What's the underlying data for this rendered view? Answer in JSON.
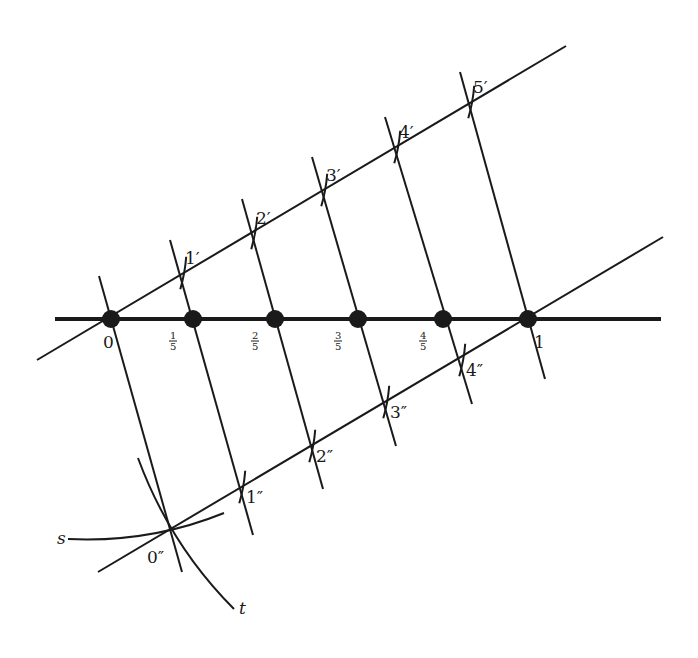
{
  "diagram": {
    "colors": {
      "ink": "#1a1a1a",
      "background": "#ffffff"
    },
    "main_line": {
      "name": "number-line",
      "from": [
        55,
        319
      ],
      "to": [
        661,
        319
      ],
      "width": 4,
      "points": [
        {
          "label": "0",
          "x": 111,
          "num": "",
          "den": "",
          "kind": "whole"
        },
        {
          "label": "1/5",
          "x": 193,
          "num": "1",
          "den": "5",
          "kind": "fraction"
        },
        {
          "label": "2/5",
          "x": 275,
          "num": "2",
          "den": "5",
          "kind": "fraction"
        },
        {
          "label": "3/5",
          "x": 358,
          "num": "3",
          "den": "5",
          "kind": "fraction"
        },
        {
          "label": "4/5",
          "x": 443,
          "num": "4",
          "den": "5",
          "kind": "fraction"
        },
        {
          "label": "1",
          "x": 528,
          "num": "",
          "den": "",
          "kind": "whole"
        }
      ]
    },
    "upper_line": {
      "from": [
        37,
        360
      ],
      "to": [
        566,
        46
      ],
      "points": [
        {
          "label": "1′",
          "x": 181,
          "y": 275
        },
        {
          "label": "2′",
          "x": 252,
          "y": 235
        },
        {
          "label": "3′",
          "x": 322,
          "y": 192
        },
        {
          "label": "4′",
          "x": 395,
          "y": 149
        },
        {
          "label": "5′",
          "x": 469,
          "y": 104
        }
      ]
    },
    "lower_line": {
      "from": [
        98,
        572
      ],
      "to": [
        663,
        237
      ],
      "points": [
        {
          "label": "0″",
          "x": 171,
          "y": 531
        },
        {
          "label": "1″",
          "x": 240,
          "y": 489
        },
        {
          "label": "2″",
          "x": 310,
          "y": 448
        },
        {
          "label": "3″",
          "x": 384,
          "y": 404
        },
        {
          "label": "4″",
          "x": 460,
          "y": 362
        }
      ]
    },
    "transversals": [
      {
        "from": [
          99,
          276
        ],
        "to": [
          182,
          572
        ]
      },
      {
        "from": [
          170,
          240
        ],
        "to": [
          253,
          535
        ]
      },
      {
        "from": [
          242,
          199
        ],
        "to": [
          323,
          489
        ]
      },
      {
        "from": [
          312,
          157
        ],
        "to": [
          396,
          446
        ]
      },
      {
        "from": [
          385,
          117
        ],
        "to": [
          472,
          404
        ]
      },
      {
        "from": [
          460,
          72
        ],
        "to": [
          545,
          379
        ]
      }
    ],
    "arcs": {
      "s": {
        "label": "s",
        "path": "M 68 539 Q 150 543 224 513",
        "label_pos": [
          57,
          544
        ]
      },
      "t": {
        "label": "t",
        "path": "M 138 458 Q 170 545 234 609",
        "label_pos": [
          239,
          614
        ]
      }
    },
    "labels": {
      "zero": "0",
      "one": "1",
      "s": "s",
      "t": "t"
    }
  }
}
